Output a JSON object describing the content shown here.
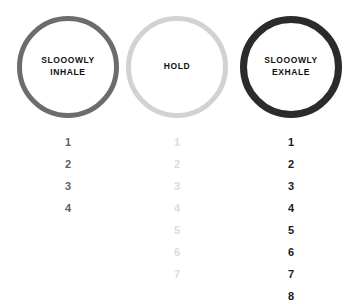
{
  "canvas": {
    "width": 354,
    "height": 296,
    "background": "#ffffff"
  },
  "phases": [
    {
      "id": "inhale",
      "circle_label": "SLOOOWLY\nINHALE",
      "circle_label_line1": "SLOOOWLY",
      "circle_label_line2": "INHALE",
      "ring_color": "#6c6c6c",
      "ring_width_px": 5,
      "text_color": "#111111",
      "count_color": "#5f5f5f",
      "counts": [
        "1",
        "2",
        "3",
        "4"
      ],
      "count_total": 4
    },
    {
      "id": "hold",
      "circle_label": "HOLD",
      "circle_label_line1": "HOLD",
      "circle_label_line2": "",
      "ring_color": "#d2d2d2",
      "ring_width_px": 5,
      "text_color": "#111111",
      "count_color": "#dcdcdc",
      "counts": [
        "1",
        "2",
        "3",
        "4",
        "5",
        "6",
        "7"
      ],
      "count_total": 7
    },
    {
      "id": "exhale",
      "circle_label": "SLOOOWLY\nEXHALE",
      "circle_label_line1": "SLOOOWLY",
      "circle_label_line2": "EXHALE",
      "ring_color": "#2b2b2b",
      "ring_width_px": 7,
      "text_color": "#111111",
      "count_color": "#1a1a1a",
      "counts": [
        "1",
        "2",
        "3",
        "4",
        "5",
        "6",
        "7",
        "8"
      ],
      "count_total": 8
    }
  ]
}
